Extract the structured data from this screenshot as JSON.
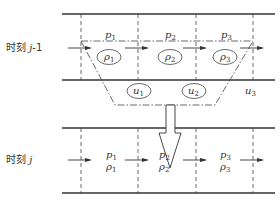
{
  "diagram": {
    "type": "traffic-flow-cell-transmission",
    "sections": [
      {
        "id": "prev",
        "time_label": "时刻 j-1",
        "time_label_parts": {
          "prefix": "时刻 ",
          "var": "j",
          "suffix": "-1"
        },
        "cells": [
          {
            "p": "p",
            "p_sub": "1",
            "rho": "ρ",
            "rho_sub": "1"
          },
          {
            "p": "p",
            "p_sub": "2",
            "rho": "ρ",
            "rho_sub": "2"
          },
          {
            "p": "p",
            "p_sub": "3",
            "rho": "ρ",
            "rho_sub": "3"
          }
        ],
        "ramp_labels": [
          {
            "u": "u",
            "u_sub": "1",
            "circled": true
          },
          {
            "u": "u",
            "u_sub": "2",
            "circled": true
          },
          {
            "u": "u",
            "u_sub": "3",
            "circled": false
          }
        ]
      },
      {
        "id": "curr",
        "time_label": "时刻 j",
        "time_label_parts": {
          "prefix": "时刻 ",
          "var": "j",
          "suffix": ""
        },
        "cells": [
          {
            "p": "p",
            "p_sub": "1",
            "rho": "ρ",
            "rho_sub": "1"
          },
          {
            "p": "p",
            "p_sub": "2",
            "rho": "ρ",
            "rho_sub": "2"
          },
          {
            "p": "p",
            "p_sub": "3",
            "rho": "ρ",
            "rho_sub": "3"
          }
        ]
      }
    ],
    "transition_arrow": "down",
    "colors": {
      "line": "#333333",
      "background": "#ffffff"
    }
  }
}
